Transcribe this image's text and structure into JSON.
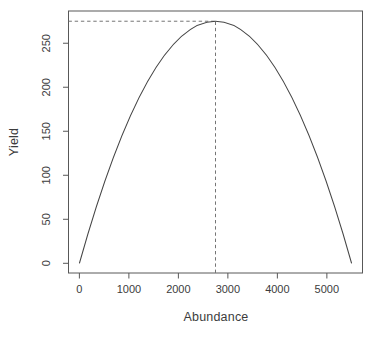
{
  "colors": {
    "background": "#ffffff",
    "curve": "#454545",
    "axis": "#585858",
    "dashed": "#757575",
    "text": "#3c3c3c"
  },
  "chart_data": {
    "type": "line",
    "title": "",
    "xlabel": "Abundance",
    "ylabel": "Yield",
    "x_ticks": [
      0,
      1000,
      2000,
      3000,
      4000,
      5000
    ],
    "y_ticks": [
      0,
      50,
      100,
      150,
      200,
      250
    ],
    "xlim": [
      -220,
      5720
    ],
    "ylim": [
      -11.02,
      286.62
    ],
    "grid": false,
    "legend": "none",
    "y_tick_labels_rotated": true,
    "series": [
      {
        "name": "yield-curve",
        "shape": "parabola",
        "peak": {
          "x": 2750,
          "y": 275
        },
        "x": [
          0,
          250,
          500,
          750,
          1000,
          1250,
          1500,
          1750,
          2000,
          2250,
          2500,
          2750,
          3000,
          3250,
          3500,
          3750,
          4000,
          4250,
          4500,
          4750,
          5000,
          5250,
          5500
        ],
        "y": [
          0,
          47.73,
          90.91,
          129.55,
          163.64,
          193.18,
          218.18,
          238.64,
          254.55,
          265.91,
          272.73,
          275,
          272.73,
          265.91,
          254.55,
          238.64,
          218.18,
          193.18,
          163.64,
          129.55,
          90.91,
          47.73,
          0
        ]
      }
    ],
    "annotations": [
      {
        "type": "vline",
        "style": "dashed",
        "x": 2750,
        "y_to": 275,
        "from_edge": "bottom"
      },
      {
        "type": "hline",
        "style": "dashed",
        "y": 275,
        "x_to": 2750,
        "from_edge": "left"
      }
    ]
  }
}
